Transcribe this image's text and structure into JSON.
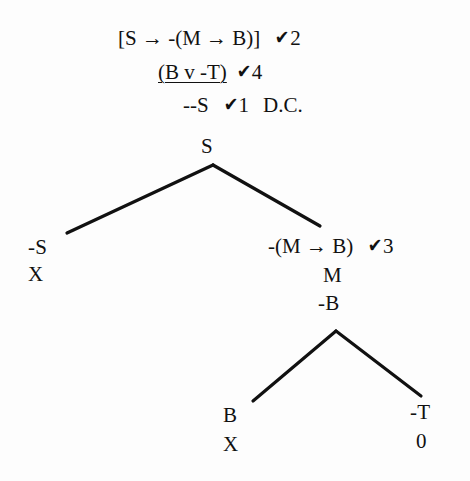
{
  "document": {
    "title": "Truth Tree Derivation",
    "ink_color": "#111111",
    "background_color": "#fdfdfd"
  },
  "check_glyph": "✔",
  "arrow_glyph": "→",
  "premises": [
    {
      "id": "premise-1",
      "formula": "[S → -(M → B)]",
      "check": "✔",
      "check_number": "2",
      "underlined": false,
      "note": ""
    },
    {
      "id": "premise-2",
      "formula": "(B v -T)",
      "check": "✔",
      "check_number": "4",
      "underlined": true,
      "note": ""
    },
    {
      "id": "premise-3",
      "formula": "--S",
      "check": "✔",
      "check_number": "1",
      "underlined": false,
      "note": "D.C."
    }
  ],
  "tree": {
    "root": {
      "id": "node-s",
      "label": "S"
    },
    "left_branch": {
      "formula": {
        "id": "node-neg-s",
        "label": "-S"
      },
      "closure": {
        "id": "closure-left",
        "label": "X"
      }
    },
    "right_branch": {
      "formula": {
        "id": "node-neg-m-arrow-b",
        "label": "-(M → B)"
      },
      "check": "✔",
      "check_number": "3",
      "decomposition": [
        {
          "id": "node-m",
          "label": "M"
        },
        {
          "id": "node-neg-b",
          "label": "-B"
        }
      ],
      "sub_left": {
        "formula": {
          "id": "node-b",
          "label": "B"
        },
        "closure": {
          "id": "closure-b",
          "label": "X"
        }
      },
      "sub_right": {
        "formula": {
          "id": "node-neg-t",
          "label": "-T"
        },
        "closure": {
          "id": "closure-t",
          "label": "0"
        }
      }
    }
  }
}
